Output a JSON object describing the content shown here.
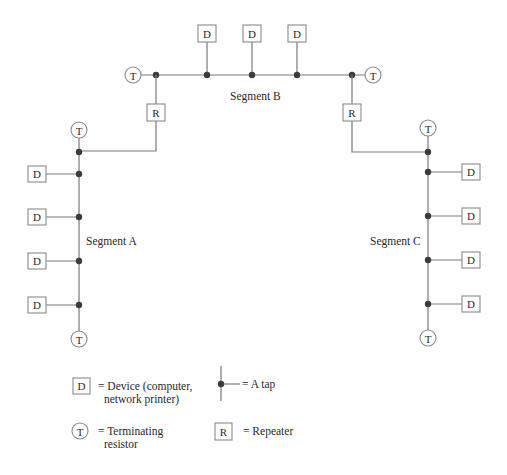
{
  "diagram": {
    "title": "",
    "colors": {
      "wire": "#7a7a7a",
      "border": "#8a8a8a",
      "tap": "#3c3c3c",
      "text": "#2a2a2a",
      "background": "#ffffff"
    },
    "symbols": {
      "device": "D",
      "terminator": "T",
      "repeater": "R"
    },
    "segments": [
      {
        "id": "A",
        "label": "Segment A",
        "orientation": "vertical",
        "devices": 4,
        "device_side": "left"
      },
      {
        "id": "B",
        "label": "Segment B",
        "orientation": "horizontal",
        "devices": 3,
        "device_side": "top"
      },
      {
        "id": "C",
        "label": "Segment C",
        "orientation": "vertical",
        "devices": 4,
        "device_side": "right"
      }
    ],
    "repeaters": [
      {
        "id": "R1",
        "connects": [
          "A",
          "B"
        ]
      },
      {
        "id": "R2",
        "connects": [
          "B",
          "C"
        ]
      }
    ]
  },
  "legend": {
    "device": {
      "symbol": "D",
      "line1": "= Device (computer,",
      "line2": "network printer)"
    },
    "tap": {
      "line1": "= A tap"
    },
    "terminator": {
      "symbol": "T",
      "line1": "= Terminating",
      "line2": "resistor"
    },
    "repeater": {
      "symbol": "R",
      "line1": "= Repeater"
    }
  }
}
